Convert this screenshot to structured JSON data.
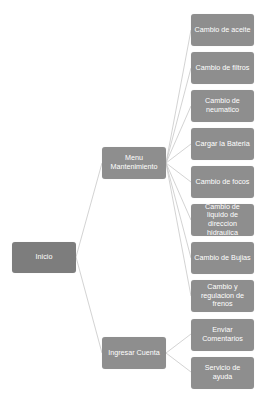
{
  "diagram": {
    "type": "tree",
    "orientation": "left-to-right",
    "colors": {
      "node_fill": "#8e8e8e",
      "root_fill": "#7d7d7d",
      "node_text": "#ffffff",
      "connector": "#c8c8c8",
      "background": "#ffffff"
    },
    "root": {
      "label": "Inicio"
    },
    "branches": [
      {
        "label": "Menu Mantenimiento",
        "children": [
          {
            "label": "Cambio de aceite"
          },
          {
            "label": "Cambio de filtros"
          },
          {
            "label": "Cambio de neumatico"
          },
          {
            "label": "Cargar la Bateria"
          },
          {
            "label": "Cambio de focos"
          },
          {
            "label": "Cambio de liquido de direccion hidraulica"
          },
          {
            "label": "Cambio de Bujias"
          },
          {
            "label": "Cambio y regulacion de frenos"
          }
        ]
      },
      {
        "label": "Ingresar Cuenta",
        "children": [
          {
            "label": "Enviar Comentarios"
          },
          {
            "label": "Servicio de ayuda"
          }
        ]
      }
    ]
  }
}
